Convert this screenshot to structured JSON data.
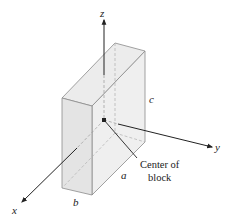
{
  "diagram": {
    "type": "3d-block-axes",
    "axes": {
      "z_label": "z",
      "y_label": "y",
      "x_label": "x"
    },
    "dimensions": {
      "a_label": "a",
      "b_label": "b",
      "c_label": "c"
    },
    "annotation": {
      "line1": "Center of",
      "line2": "block"
    },
    "colors": {
      "block_front": "#e6e6e6",
      "block_top": "#eeeeee",
      "block_side": "#f2f2f2",
      "edge": "#8a8a8a",
      "axis": "#222222"
    }
  }
}
